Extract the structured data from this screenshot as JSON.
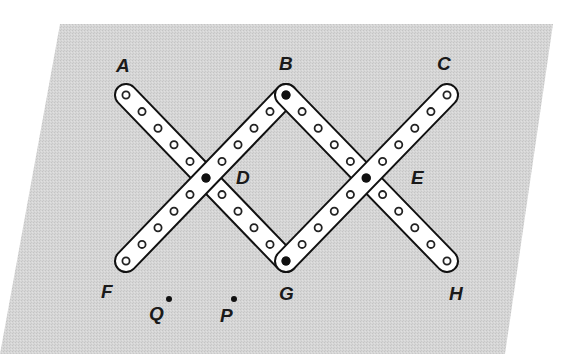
{
  "figure": {
    "colors": {
      "background": "#ffffff",
      "plane": "#d4d4d4",
      "bar_fill": "#ffffff",
      "bar_stroke": "#111111",
      "hole_stroke": "#222222",
      "pivot": "#111111",
      "label": "#1a1a1a"
    },
    "plane": {
      "points": [
        [
          60,
          24
        ],
        [
          553,
          24
        ],
        [
          505,
          354
        ],
        [
          0,
          354
        ]
      ]
    },
    "holes_per_bar": 11,
    "bars": [
      {
        "name": "bar-AG",
        "from": [
          126,
          95
        ],
        "to": [
          286,
          261
        ]
      },
      {
        "name": "bar-FB",
        "from": [
          126,
          261
        ],
        "to": [
          286,
          95
        ]
      },
      {
        "name": "bar-BH",
        "from": [
          286,
          95
        ],
        "to": [
          447,
          261
        ]
      },
      {
        "name": "bar-GC",
        "from": [
          286,
          261
        ],
        "to": [
          447,
          95
        ]
      }
    ],
    "pivots": [
      {
        "name": "B",
        "x": 286,
        "y": 95
      },
      {
        "name": "D",
        "x": 206,
        "y": 178
      },
      {
        "name": "E",
        "x": 366,
        "y": 178
      },
      {
        "name": "G",
        "x": 286,
        "y": 261
      }
    ],
    "free_points": [
      {
        "name": "Q",
        "x": 169,
        "y": 299
      },
      {
        "name": "P",
        "x": 234,
        "y": 299
      }
    ],
    "labels": [
      {
        "text": "A",
        "x": 116,
        "y": 72
      },
      {
        "text": "B",
        "x": 279,
        "y": 70
      },
      {
        "text": "C",
        "x": 437,
        "y": 70
      },
      {
        "text": "D",
        "x": 236,
        "y": 184
      },
      {
        "text": "E",
        "x": 411,
        "y": 184
      },
      {
        "text": "F",
        "x": 101,
        "y": 298
      },
      {
        "text": "G",
        "x": 279,
        "y": 300
      },
      {
        "text": "H",
        "x": 449,
        "y": 300
      },
      {
        "text": "Q",
        "x": 149,
        "y": 320
      },
      {
        "text": "P",
        "x": 220,
        "y": 322
      }
    ]
  }
}
